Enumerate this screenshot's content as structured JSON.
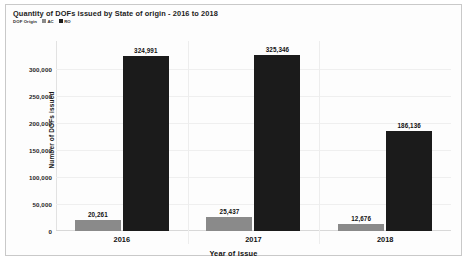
{
  "chart_data": {
    "type": "bar",
    "title": "Quantity of DOFs issued by State of origin - 2016 to 2018",
    "xlabel": "Year of issue",
    "ylabel": "Number of DOFs issued",
    "categories": [
      "2016",
      "2017",
      "2018"
    ],
    "series": [
      {
        "name": "AC",
        "color": "#8a8a8a",
        "values": [
          20261,
          25437,
          12676
        ],
        "labels": [
          "20,261",
          "25,437",
          "12,676"
        ]
      },
      {
        "name": "RO",
        "color": "#1b1b1b",
        "values": [
          324991,
          325346,
          186136
        ],
        "labels": [
          "324,991",
          "325,346",
          "186,136"
        ]
      }
    ],
    "legend_title": "DOF Origin",
    "legend_position": "top-left",
    "ylim": [
      0,
      300000
    ],
    "yticks": [
      0,
      50000,
      100000,
      150000,
      200000,
      250000,
      300000
    ],
    "ytick_labels": [
      "0",
      "50,000",
      "100,000",
      "150,000",
      "200,000",
      "250,000",
      "300,000"
    ],
    "grid": true,
    "axis_max_render": 352000
  }
}
